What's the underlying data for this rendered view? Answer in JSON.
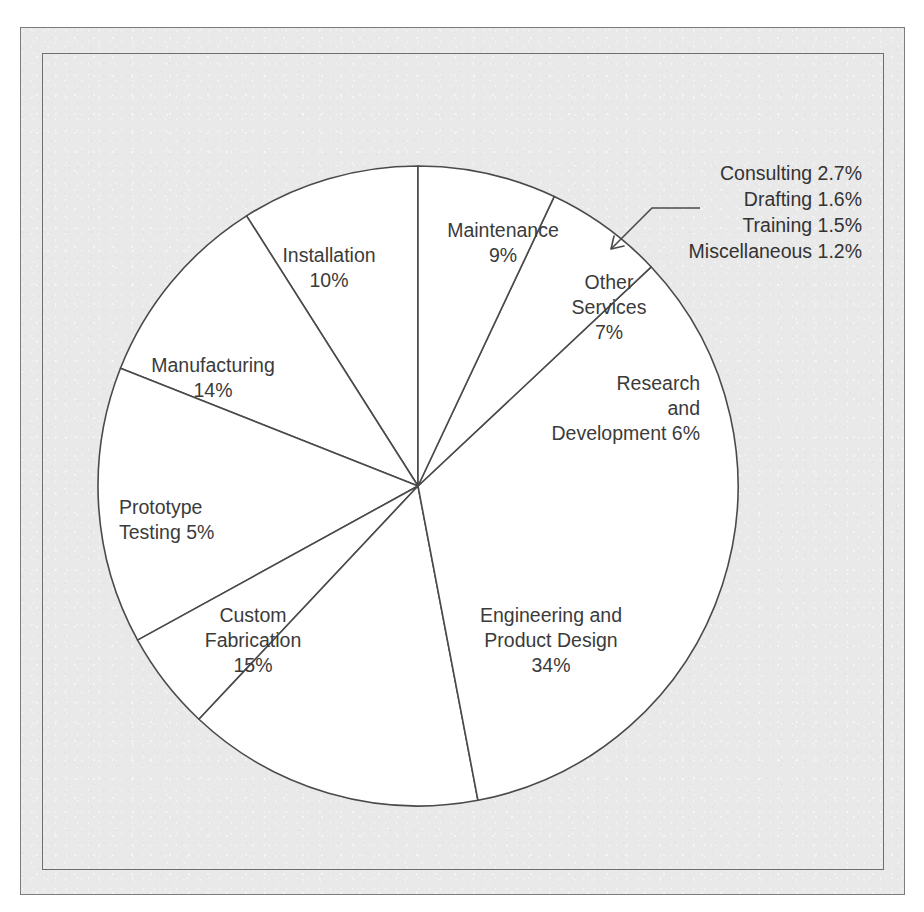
{
  "chart_data": {
    "type": "pie",
    "title": "",
    "subtitle": "",
    "xlabel": "",
    "ylabel": "",
    "legend_position": "none",
    "grid": false,
    "units": "percent",
    "total": 100,
    "start_angle_deg": 90,
    "direction": "counterclockwise",
    "categories": [
      "Maintenance",
      "Installation",
      "Manufacturing",
      "Prototype Testing",
      "Custom Fabrication",
      "Engineering and Product Design",
      "Research and Development",
      "Other Services"
    ],
    "values": [
      9,
      10,
      14,
      5,
      15,
      34,
      6,
      7
    ],
    "slices": [
      {
        "name": "Maintenance",
        "value": 9,
        "label_lines": [
          "Maintenance",
          "9%"
        ],
        "label_x": 503,
        "label_y": 237,
        "label_anchor": "middle",
        "line_height": 25
      },
      {
        "name": "Installation",
        "value": 10,
        "label_lines": [
          "Installation",
          "10%"
        ],
        "label_x": 329,
        "label_y": 262,
        "label_anchor": "middle",
        "line_height": 25
      },
      {
        "name": "Manufacturing",
        "value": 14,
        "label_lines": [
          "Manufacturing",
          "14%"
        ],
        "label_x": 213,
        "label_y": 372,
        "label_anchor": "middle",
        "line_height": 25
      },
      {
        "name": "Prototype Testing",
        "value": 5,
        "label_lines": [
          "Prototype",
          "Testing 5%"
        ],
        "label_x": 119,
        "label_y": 514,
        "label_anchor": "start",
        "line_height": 25
      },
      {
        "name": "Custom Fabrication",
        "value": 15,
        "label_lines": [
          "Custom",
          "Fabrication",
          "15%"
        ],
        "label_x": 253,
        "label_y": 622,
        "label_anchor": "middle",
        "line_height": 25
      },
      {
        "name": "Engineering and Product Design",
        "value": 34,
        "label_lines": [
          "Engineering and",
          "Product Design",
          "34%"
        ],
        "label_x": 551,
        "label_y": 622,
        "label_anchor": "middle",
        "line_height": 25
      },
      {
        "name": "Research and Development",
        "value": 6,
        "label_lines": [
          "Research",
          "and",
          "Development 6%"
        ],
        "label_x": 700,
        "label_y": 390,
        "label_anchor": "end",
        "line_height": 25
      },
      {
        "name": "Other Services",
        "value": 7,
        "label_lines": [
          "Other",
          "Services",
          "7%"
        ],
        "label_x": 609,
        "label_y": 289,
        "label_anchor": "middle",
        "line_height": 25
      }
    ],
    "callout": {
      "attached_to": "Other Services",
      "anchor_x": 862,
      "first_line_y": 180,
      "line_height": 26,
      "text_anchor": "end",
      "items": [
        {
          "name": "Consulting",
          "value": 2.7,
          "text": "Consulting 2.7%"
        },
        {
          "name": "Drafting",
          "value": 1.6,
          "text": "Drafting 1.6%"
        },
        {
          "name": "Training",
          "value": 1.5,
          "text": "Training 1.5%"
        },
        {
          "name": "Miscellaneous",
          "value": 1.2,
          "text": "Miscellaneous 1.2%"
        }
      ]
    },
    "geometry": {
      "center_x": 418,
      "center_y": 486,
      "radius": 320
    },
    "colors": {
      "slice_fill": "#ffffff",
      "slice_stroke": "#4a4a4a",
      "text": "#3b3b3b",
      "background": "#e9e9e9",
      "frame": "#7c7c7c"
    }
  }
}
